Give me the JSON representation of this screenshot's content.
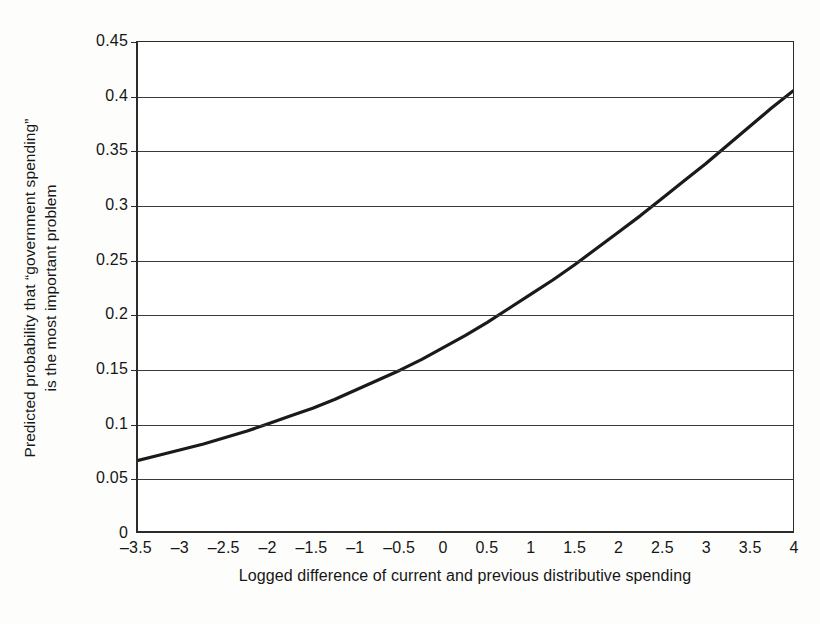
{
  "chart_data": {
    "type": "line",
    "title": "",
    "xlabel": "Logged difference of current and previous distributive spending",
    "ylabel_line1": "Predicted probability that “government spending”",
    "ylabel_line2": "is the most important problem",
    "xlim": [
      -3.5,
      4
    ],
    "ylim": [
      0,
      0.45
    ],
    "grid": "horizontal",
    "legend": "none",
    "xticks": [
      "-3.5",
      "-3",
      "-2.5",
      "-2",
      "-1.5",
      "-1",
      "-0.5",
      "0",
      "0.5",
      "1",
      "1.5",
      "2",
      "2.5",
      "3",
      "3.5",
      "4"
    ],
    "xtick_values": [
      -3.5,
      -3,
      -2.5,
      -2,
      -1.5,
      -1,
      -0.5,
      0,
      0.5,
      1,
      1.5,
      2,
      2.5,
      3,
      3.5,
      4
    ],
    "yticks": [
      "0",
      "0.05",
      "0.1",
      "0.15",
      "0.2",
      "0.25",
      "0.3",
      "0.35",
      "0.4",
      "0.45"
    ],
    "ytick_values": [
      0,
      0.05,
      0.1,
      0.15,
      0.2,
      0.25,
      0.3,
      0.35,
      0.4,
      0.45
    ],
    "series": [
      {
        "name": "Predicted probability",
        "color": "#1a1a1a",
        "x": [
          -3.5,
          -3.25,
          -3,
          -2.75,
          -2.5,
          -2.25,
          -2,
          -1.75,
          -1.5,
          -1.25,
          -1,
          -0.75,
          -0.5,
          -0.25,
          0,
          0.25,
          0.5,
          0.75,
          1,
          1.25,
          1.5,
          1.75,
          2,
          2.25,
          2.5,
          2.75,
          3,
          3.25,
          3.5,
          3.75,
          4
        ],
        "values": [
          0.065,
          0.07,
          0.075,
          0.08,
          0.086,
          0.092,
          0.099,
          0.106,
          0.113,
          0.121,
          0.13,
          0.139,
          0.148,
          0.158,
          0.169,
          0.18,
          0.192,
          0.205,
          0.218,
          0.231,
          0.245,
          0.26,
          0.275,
          0.29,
          0.306,
          0.322,
          0.338,
          0.355,
          0.372,
          0.389,
          0.405
        ]
      }
    ]
  }
}
